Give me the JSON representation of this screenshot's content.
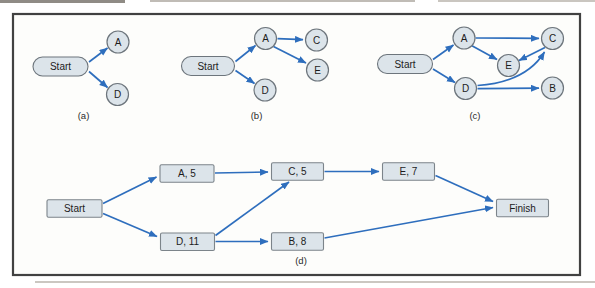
{
  "figure": {
    "captions": [
      "(a)",
      "(b)",
      "(c)",
      "(d)"
    ]
  },
  "colors": {
    "arrow": "#2e6ebd",
    "node_fill": "#dce4ea",
    "node_stroke": "#6d757c",
    "rect_stroke": "#7c848a",
    "text": "#1c1c1c",
    "frame_stroke": "#414141",
    "inner_bg": "#fdfdfb"
  },
  "diagrams": [
    {
      "id": "a",
      "caption": "(a)",
      "caption_x": 83.5,
      "caption_y": 115.5,
      "nodes": [
        {
          "id": "Start",
          "shape": "pill",
          "label": "Start",
          "x": 60.5,
          "y": 66.5,
          "w": 55,
          "h": 19
        },
        {
          "id": "A",
          "shape": "circle",
          "label": "A",
          "x": 118,
          "y": 42,
          "r": 11
        },
        {
          "id": "D",
          "shape": "circle",
          "label": "D",
          "x": 117.5,
          "y": 94.5,
          "r": 11
        }
      ],
      "edges": [
        {
          "from": "Start",
          "to": "A",
          "x1": 89,
          "y1": 62,
          "x2": 107.5,
          "y2": 48
        },
        {
          "from": "Start",
          "to": "D",
          "x1": 89,
          "y1": 71.5,
          "x2": 107.5,
          "y2": 87.5
        }
      ]
    },
    {
      "id": "b",
      "caption": "(b)",
      "caption_x": 256.5,
      "caption_y": 115.5,
      "nodes": [
        {
          "id": "Start",
          "shape": "pill",
          "label": "Start",
          "x": 208,
          "y": 66,
          "w": 53,
          "h": 19
        },
        {
          "id": "A",
          "shape": "circle",
          "label": "A",
          "x": 265.5,
          "y": 38.5,
          "r": 11
        },
        {
          "id": "C",
          "shape": "circle",
          "label": "C",
          "x": 316.5,
          "y": 40,
          "r": 11
        },
        {
          "id": "E",
          "shape": "circle",
          "label": "E",
          "x": 317.5,
          "y": 70,
          "r": 11
        },
        {
          "id": "D",
          "shape": "circle",
          "label": "D",
          "x": 265,
          "y": 90,
          "r": 11
        }
      ],
      "edges": [
        {
          "from": "Start",
          "to": "A",
          "x1": 235.5,
          "y1": 61.5,
          "x2": 255.5,
          "y2": 45.5
        },
        {
          "from": "Start",
          "to": "D",
          "x1": 235.5,
          "y1": 70.5,
          "x2": 254.5,
          "y2": 83.5
        },
        {
          "from": "A",
          "to": "C",
          "x1": 277.5,
          "y1": 38.7,
          "x2": 303,
          "y2": 39.7
        },
        {
          "from": "A",
          "to": "E",
          "x1": 273.5,
          "y1": 46.5,
          "x2": 306,
          "y2": 63
        }
      ]
    },
    {
      "id": "c",
      "caption": "(c)",
      "caption_x": 475,
      "caption_y": 115.5,
      "nodes": [
        {
          "id": "Start",
          "shape": "pill",
          "label": "Start",
          "x": 405,
          "y": 64,
          "w": 55,
          "h": 19
        },
        {
          "id": "A",
          "shape": "circle",
          "label": "A",
          "x": 464,
          "y": 38,
          "r": 11
        },
        {
          "id": "C",
          "shape": "circle",
          "label": "C",
          "x": 552.5,
          "y": 38.5,
          "r": 11
        },
        {
          "id": "E",
          "shape": "circle",
          "label": "E",
          "x": 508.5,
          "y": 65.5,
          "r": 11
        },
        {
          "id": "D",
          "shape": "circle",
          "label": "D",
          "x": 465.5,
          "y": 88.5,
          "r": 11
        },
        {
          "id": "B",
          "shape": "circle",
          "label": "B",
          "x": 552.5,
          "y": 88,
          "r": 11
        }
      ],
      "edges": [
        {
          "from": "Start",
          "to": "A",
          "x1": 433,
          "y1": 59.5,
          "x2": 453.5,
          "y2": 45
        },
        {
          "from": "Start",
          "to": "D",
          "x1": 433,
          "y1": 69,
          "x2": 455,
          "y2": 82.5
        },
        {
          "from": "A",
          "to": "C",
          "x1": 475.5,
          "y1": 38,
          "x2": 539,
          "y2": 38.4
        },
        {
          "from": "A",
          "to": "E",
          "x1": 471.5,
          "y1": 45.5,
          "x2": 497,
          "y2": 59.5
        },
        {
          "from": "C",
          "to": "E",
          "x1": 545,
          "y1": 47.5,
          "x2": 519,
          "y2": 60.5
        },
        {
          "from": "D",
          "to": "B",
          "x1": 477.5,
          "y1": 88.7,
          "x2": 539,
          "y2": 88.2
        },
        {
          "from": "D",
          "to": "C",
          "path": "M 477.5 85.5 C 506 83.5 531 74 544.5 52"
        }
      ]
    },
    {
      "id": "d",
      "caption": "(d)",
      "caption_x": 301,
      "caption_y": 261,
      "nodes": [
        {
          "id": "Start",
          "shape": "rect",
          "label": "Start",
          "x": 74.5,
          "y": 208.5,
          "w": 55,
          "h": 17.5
        },
        {
          "id": "A5",
          "shape": "rect",
          "label": "A, 5",
          "x": 187,
          "y": 173.5,
          "w": 54,
          "h": 17.5
        },
        {
          "id": "D11",
          "shape": "rect",
          "label": "D, 11",
          "x": 187.5,
          "y": 241.8,
          "w": 54,
          "h": 17.5
        },
        {
          "id": "C5",
          "shape": "rect",
          "label": "C, 5",
          "x": 297.5,
          "y": 171.5,
          "w": 52,
          "h": 17.5
        },
        {
          "id": "B8",
          "shape": "rect",
          "label": "B, 8",
          "x": 297.5,
          "y": 241.5,
          "w": 52,
          "h": 17.5
        },
        {
          "id": "E7",
          "shape": "rect",
          "label": "E, 7",
          "x": 408.5,
          "y": 171.5,
          "w": 52,
          "h": 17.5
        },
        {
          "id": "Finish",
          "shape": "rect",
          "label": "Finish",
          "x": 522.5,
          "y": 208,
          "w": 52,
          "h": 17.5
        }
      ],
      "edges": [
        {
          "from": "Start",
          "to": "A5",
          "x1": 103,
          "y1": 203.5,
          "x2": 156.5,
          "y2": 177
        },
        {
          "from": "Start",
          "to": "D11",
          "x1": 103,
          "y1": 213.5,
          "x2": 157,
          "y2": 236.5
        },
        {
          "from": "A5",
          "to": "C5",
          "x1": 215,
          "y1": 173,
          "x2": 268,
          "y2": 172
        },
        {
          "from": "D11",
          "to": "C5",
          "x1": 215.5,
          "y1": 235.5,
          "x2": 289,
          "y2": 182
        },
        {
          "from": "D11",
          "to": "B8",
          "x1": 215.5,
          "y1": 241.5,
          "x2": 268,
          "y2": 241.5
        },
        {
          "from": "C5",
          "to": "E7",
          "x1": 324.5,
          "y1": 171.5,
          "x2": 379,
          "y2": 171.5
        },
        {
          "from": "E7",
          "to": "Finish",
          "x1": 435.5,
          "y1": 175.5,
          "x2": 493,
          "y2": 201.5
        },
        {
          "from": "B8",
          "to": "Finish",
          "x1": 324.5,
          "y1": 238,
          "x2": 493,
          "y2": 207.5
        }
      ]
    }
  ]
}
